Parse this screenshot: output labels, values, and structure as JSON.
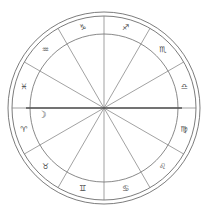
{
  "chart": {
    "type": "zodiac-wheel",
    "center": {
      "x": 104,
      "y": 108
    },
    "radii": {
      "outer_outer": 96,
      "outer_inner": 92,
      "zodiac_inner": 74
    },
    "colors": {
      "background": "#ffffff",
      "ring_stroke": "#5a5a5a",
      "spoke_stroke": "#7a7a7a",
      "axis_stroke": "#555555",
      "glyph_fill": "#4a4a4a"
    },
    "rings": [
      {
        "name": "outer-circle-outer",
        "radius": 96
      },
      {
        "name": "outer-circle-inner",
        "radius": 92
      },
      {
        "name": "inner-circle",
        "radius": 74
      }
    ],
    "axis": {
      "name": "ascendant-descendant-axis",
      "label": "Ascendant / Descendant horizontal axis",
      "angle_deg": 0
    },
    "signs": [
      {
        "name": "capricorn",
        "label": "♑",
        "sign_name": "Capricorn",
        "glyph_angle_deg": 105,
        "sector_start_deg": 90,
        "sector_end_deg": 120
      },
      {
        "name": "aquarius",
        "label": "♒",
        "sign_name": "Aquarius",
        "glyph_angle_deg": 135,
        "sector_start_deg": 120,
        "sector_end_deg": 150
      },
      {
        "name": "pisces",
        "label": "♓",
        "sign_name": "Pisces",
        "glyph_angle_deg": 165,
        "sector_start_deg": 150,
        "sector_end_deg": 180
      },
      {
        "name": "aries",
        "label": "♈",
        "sign_name": "Aries",
        "glyph_angle_deg": 195,
        "sector_start_deg": 180,
        "sector_end_deg": 210
      },
      {
        "name": "taurus",
        "label": "♉",
        "sign_name": "Taurus",
        "glyph_angle_deg": 225,
        "sector_start_deg": 210,
        "sector_end_deg": 240
      },
      {
        "name": "gemini",
        "label": "♊",
        "sign_name": "Gemini",
        "glyph_angle_deg": 255,
        "sector_start_deg": 240,
        "sector_end_deg": 270
      },
      {
        "name": "cancer",
        "label": "♋",
        "sign_name": "Cancer",
        "glyph_angle_deg": 285,
        "sector_start_deg": 270,
        "sector_end_deg": 300
      },
      {
        "name": "leo",
        "label": "♌",
        "sign_name": "Leo",
        "glyph_angle_deg": 315,
        "sector_start_deg": 300,
        "sector_end_deg": 330
      },
      {
        "name": "virgo",
        "label": "♍",
        "sign_name": "Virgo",
        "glyph_angle_deg": 345,
        "sector_start_deg": 330,
        "sector_end_deg": 360
      },
      {
        "name": "libra",
        "label": "♎",
        "sign_name": "Libra",
        "glyph_angle_deg": 15,
        "sector_start_deg": 0,
        "sector_end_deg": 30
      },
      {
        "name": "scorpio",
        "label": "♏",
        "sign_name": "Scorpio",
        "glyph_angle_deg": 45,
        "sector_start_deg": 30,
        "sector_end_deg": 60
      },
      {
        "name": "sagittarius",
        "label": "♐",
        "sign_name": "Sagittarius",
        "glyph_angle_deg": 75,
        "sector_start_deg": 60,
        "sector_end_deg": 90
      }
    ],
    "planets": [
      {
        "name": "moon",
        "label": "☽",
        "planet_name": "Moon",
        "angle_deg": 186,
        "radius": 62
      }
    ]
  }
}
